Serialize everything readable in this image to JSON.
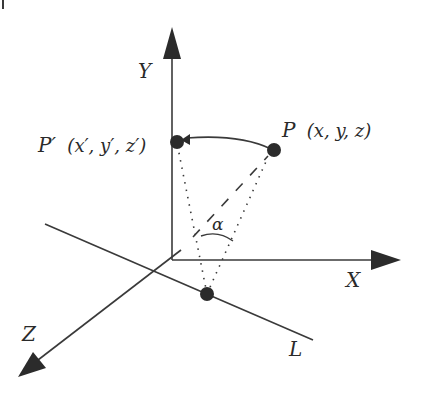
{
  "diagram": {
    "colors": {
      "line": "#3a3a3a",
      "fill": "#2b2b2b",
      "background": "#ffffff"
    },
    "axes": {
      "x": {
        "label": "X"
      },
      "y": {
        "label": "Y"
      },
      "z": {
        "label": "Z"
      }
    },
    "line_l": {
      "label": "L"
    },
    "points": {
      "p": {
        "name": "P",
        "coords": "(x, y, z)"
      },
      "p_prime": {
        "name": "P′",
        "coords": "(x′, y′, z′)"
      }
    },
    "angle": {
      "label": "α"
    }
  }
}
